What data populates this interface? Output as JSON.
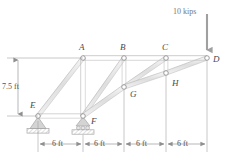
{
  "figure": {
    "type": "truss-diagram",
    "title": "",
    "colors": {
      "member_fill": "#e2e2e2",
      "member_stroke": "#a8a8a8",
      "joint_stroke": "#8a8a8a",
      "joint_fill": "#ffffff",
      "label_text": "#4a4a4a",
      "dimension_text": "#555555",
      "dimension_line": "#9a9a9a",
      "load_arrow": "#9e9e9e",
      "load_text": "#777777",
      "support_fill": "#cccccc",
      "hatch": "#b0b0b0"
    }
  },
  "joints": [
    {
      "name": "A",
      "label": "A",
      "x_ft": 6,
      "y_ft": 7.5,
      "label_pos": "above"
    },
    {
      "name": "B",
      "label": "B",
      "x_ft": 12,
      "y_ft": 7.5,
      "label_pos": "above"
    },
    {
      "name": "C",
      "label": "C",
      "x_ft": 18,
      "y_ft": 7.5,
      "label_pos": "above"
    },
    {
      "name": "D",
      "label": "D",
      "x_ft": 24,
      "y_ft": 7.5,
      "label_pos": "right"
    },
    {
      "name": "E",
      "label": "E",
      "x_ft": 0,
      "y_ft": 0,
      "label_pos": "above-left"
    },
    {
      "name": "F",
      "label": "F",
      "x_ft": 6,
      "y_ft": 0,
      "label_pos": "below-right"
    },
    {
      "name": "G",
      "label": "G",
      "x_ft": 12,
      "y_ft": 3.75,
      "label_pos": "below-right"
    },
    {
      "name": "H",
      "label": "H",
      "x_ft": 18,
      "y_ft": 5.63,
      "label_pos": "below-right"
    }
  ],
  "members": [
    {
      "from": "E",
      "to": "A"
    },
    {
      "from": "E",
      "to": "F"
    },
    {
      "from": "A",
      "to": "B"
    },
    {
      "from": "B",
      "to": "C"
    },
    {
      "from": "C",
      "to": "D"
    },
    {
      "from": "A",
      "to": "F"
    },
    {
      "from": "F",
      "to": "B"
    },
    {
      "from": "F",
      "to": "G"
    },
    {
      "from": "G",
      "to": "B"
    },
    {
      "from": "G",
      "to": "C"
    },
    {
      "from": "G",
      "to": "H"
    },
    {
      "from": "H",
      "to": "C"
    },
    {
      "from": "H",
      "to": "D"
    }
  ],
  "supports": [
    {
      "at": "E",
      "kind": "pin-support"
    },
    {
      "at": "F",
      "kind": "roller-support"
    }
  ],
  "load": {
    "label": "10 kips",
    "magnitude": 10,
    "unit": "kips",
    "direction": "down",
    "applied_at": "D"
  },
  "dimensions": {
    "vertical": {
      "label": "7.5 ft",
      "value": 7.5,
      "unit": "ft"
    },
    "horizontal": [
      {
        "label": "6 ft",
        "value": 6,
        "unit": "ft"
      },
      {
        "label": "6 ft",
        "value": 6,
        "unit": "ft"
      },
      {
        "label": "6 ft",
        "value": 6,
        "unit": "ft"
      },
      {
        "label": "6 ft",
        "value": 6,
        "unit": "ft"
      }
    ]
  }
}
